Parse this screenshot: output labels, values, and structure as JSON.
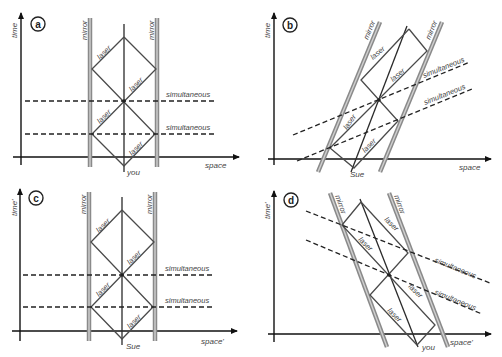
{
  "panels": [
    {
      "id": "a",
      "letter": "a",
      "time_label": "time",
      "space_label": "space",
      "mirror_left_label": "mirror",
      "mirror_right_label": "mirror",
      "observer_label": "you",
      "laser_labels": [
        "laser",
        "laser",
        "laser",
        "laser"
      ],
      "simultaneous_labels": [
        "simultaneous",
        "simultaneous"
      ]
    },
    {
      "id": "b",
      "letter": "b",
      "time_label": "time",
      "space_label": "space",
      "mirror_left_label": "mirror",
      "mirror_right_label": "mirror",
      "observer_label": "Sue",
      "laser_labels": [
        "laser",
        "laser",
        "laser",
        "laser"
      ],
      "simultaneous_labels": [
        "simultaneous",
        "simultaneous"
      ]
    },
    {
      "id": "c",
      "letter": "c",
      "time_label": "time'",
      "space_label": "space'",
      "mirror_left_label": "mirror",
      "mirror_right_label": "mirror",
      "observer_label": "Sue",
      "laser_labels": [
        "laser",
        "laser",
        "laser",
        "laser"
      ],
      "simultaneous_labels": [
        "simultaneous",
        "simultaneous"
      ]
    },
    {
      "id": "d",
      "letter": "d",
      "time_label": "time'",
      "space_label": "space'",
      "mirror_left_label": "mirror",
      "mirror_right_label": "mirror",
      "observer_label": "you",
      "laser_labels": [
        "laser",
        "laser",
        "laser",
        "laser"
      ],
      "simultaneous_labels": [
        "simultaneous",
        "simultaneous"
      ]
    }
  ],
  "colors": {
    "mirror": "#8a8a8a",
    "laser": "#4a4a4a",
    "axis": "#111111",
    "background": "#ffffff"
  }
}
